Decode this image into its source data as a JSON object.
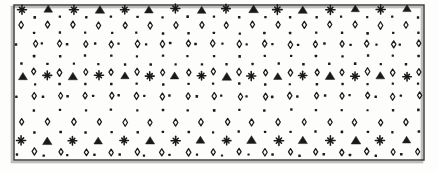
{
  "figure": {
    "name": "decorative-lattice-pattern",
    "width": 438,
    "height": 171,
    "background_color": "#fdfdfc",
    "ink_color": "#1a1a1a",
    "border": {
      "x": 14,
      "y": 5,
      "width": 410,
      "height": 155,
      "stroke_color": "#333333",
      "stroke_width": 1.4,
      "shadow_color": "#8a8a8a",
      "shadow_offset": 2
    },
    "motifs": [
      {
        "key": "star",
        "label": "eight-point-star",
        "size": 9.0
      },
      {
        "key": "triangle",
        "label": "filled-triangle",
        "size": 9.0
      },
      {
        "key": "diamond",
        "label": "open-diamond",
        "size": 7.0
      },
      {
        "key": "dot",
        "label": "small-dot",
        "size": 2.4
      }
    ],
    "lattice": {
      "column_spacing": 25.6,
      "columns": 16,
      "band_count": 5,
      "band_height": 30.5,
      "first_band_y": 11
    },
    "bands": [
      {
        "index": 0,
        "name": "accent-band-top",
        "rows": [
          {
            "name": "accent-row",
            "y": 9,
            "motifs": [
              "star",
              "triangle"
            ],
            "alternating": true,
            "x_start": 22,
            "spacing": 25.6,
            "count": 16,
            "wobble": 1.2
          },
          {
            "name": "dot-row",
            "y": 17,
            "motifs": [
              "dot"
            ],
            "x_start": 9,
            "spacing": 25.6,
            "count": 17,
            "wobble": 0.8
          },
          {
            "name": "diamond-row",
            "y": 25,
            "motifs": [
              "diamond"
            ],
            "x_start": 22,
            "spacing": 25.6,
            "count": 16,
            "wobble": 0.9
          },
          {
            "name": "dot-row",
            "y": 33,
            "motifs": [
              "dot"
            ],
            "x_start": 9,
            "spacing": 25.6,
            "count": 17,
            "wobble": 0.8
          }
        ]
      },
      {
        "index": 1,
        "name": "diamond-band-upper",
        "rows": [
          {
            "name": "diamond-row",
            "y": 44,
            "motifs": [
              "diamond"
            ],
            "x_start": 9,
            "spacing": 25.6,
            "count": 17,
            "wobble": 1.1
          },
          {
            "name": "dot-row",
            "y": 44,
            "motifs": [
              "dot"
            ],
            "x_start": 17,
            "spacing": 25.6,
            "count": 17,
            "wobble": 1.4
          },
          {
            "name": "dot-row",
            "y": 56,
            "motifs": [
              "dot"
            ],
            "x_start": 9,
            "spacing": 25.6,
            "count": 17,
            "wobble": 0.8
          }
        ]
      },
      {
        "index": 2,
        "name": "accent-band-middle",
        "rows": [
          {
            "name": "dot-row",
            "y": 64,
            "motifs": [
              "dot"
            ],
            "x_start": 22,
            "spacing": 25.6,
            "count": 16,
            "wobble": 0.8
          },
          {
            "name": "diamond-row",
            "y": 72,
            "motifs": [
              "diamond"
            ],
            "x_start": 9,
            "spacing": 25.6,
            "count": 17,
            "wobble": 1.0
          },
          {
            "name": "accent-row",
            "y": 76,
            "motifs": [
              "triangle",
              "star"
            ],
            "alternating": true,
            "x_start": 22,
            "spacing": 25.6,
            "count": 16,
            "wobble": 1.2
          },
          {
            "name": "dot-row",
            "y": 84,
            "motifs": [
              "dot"
            ],
            "x_start": 9,
            "spacing": 25.6,
            "count": 17,
            "wobble": 0.8
          }
        ]
      },
      {
        "index": 3,
        "name": "diamond-band-lower",
        "rows": [
          {
            "name": "diamond-row",
            "y": 96,
            "motifs": [
              "diamond"
            ],
            "x_start": 9,
            "spacing": 25.6,
            "count": 17,
            "wobble": 1.1
          },
          {
            "name": "dot-row",
            "y": 96,
            "motifs": [
              "dot"
            ],
            "x_start": 17,
            "spacing": 25.6,
            "count": 17,
            "wobble": 1.4
          },
          {
            "name": "dot-row",
            "y": 110,
            "motifs": [
              "dot"
            ],
            "x_start": 9,
            "spacing": 25.6,
            "count": 17,
            "wobble": 0.8
          }
        ]
      },
      {
        "index": 4,
        "name": "accent-band-bottom",
        "rows": [
          {
            "name": "diamond-row",
            "y": 122,
            "motifs": [
              "diamond"
            ],
            "x_start": 22,
            "spacing": 25.6,
            "count": 16,
            "wobble": 1.0
          },
          {
            "name": "dot-row",
            "y": 132,
            "motifs": [
              "dot"
            ],
            "x_start": 9,
            "spacing": 25.6,
            "count": 17,
            "wobble": 0.8
          },
          {
            "name": "accent-row",
            "y": 140,
            "motifs": [
              "star",
              "triangle"
            ],
            "alternating": true,
            "x_start": 22,
            "spacing": 25.6,
            "count": 16,
            "wobble": 1.2
          },
          {
            "name": "diamond-row",
            "y": 152,
            "motifs": [
              "diamond"
            ],
            "x_start": 9,
            "spacing": 25.6,
            "count": 17,
            "wobble": 1.0
          },
          {
            "name": "dot-row",
            "y": 155,
            "motifs": [
              "dot"
            ],
            "x_start": 17,
            "spacing": 25.6,
            "count": 17,
            "wobble": 1.2
          }
        ]
      }
    ]
  }
}
